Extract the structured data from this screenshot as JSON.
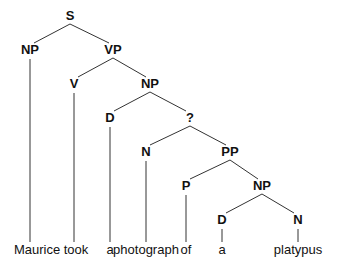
{
  "tree": {
    "nodes": [
      {
        "id": "S",
        "label": "S",
        "x": 70,
        "y": 20
      },
      {
        "id": "NP1",
        "label": "NP",
        "x": 30,
        "y": 54
      },
      {
        "id": "VP",
        "label": "VP",
        "x": 113,
        "y": 54
      },
      {
        "id": "V",
        "label": "V",
        "x": 74,
        "y": 88
      },
      {
        "id": "NP2",
        "label": "NP",
        "x": 150,
        "y": 88
      },
      {
        "id": "D1",
        "label": "D",
        "x": 110,
        "y": 122
      },
      {
        "id": "Q",
        "label": "?",
        "x": 190,
        "y": 122
      },
      {
        "id": "N1",
        "label": "N",
        "x": 146,
        "y": 156
      },
      {
        "id": "PP",
        "label": "PP",
        "x": 230,
        "y": 156
      },
      {
        "id": "P",
        "label": "P",
        "x": 186,
        "y": 190
      },
      {
        "id": "NP3",
        "label": "NP",
        "x": 262,
        "y": 190
      },
      {
        "id": "D2",
        "label": "D",
        "x": 222,
        "y": 224
      },
      {
        "id": "N2",
        "label": "N",
        "x": 298,
        "y": 224
      }
    ],
    "words": [
      {
        "text": "Maurice",
        "x": 37,
        "y": 254,
        "anchor": "middle"
      },
      {
        "text": "took",
        "x": 76,
        "y": 254,
        "anchor": "middle"
      },
      {
        "text": "a",
        "x": 110,
        "y": 254,
        "anchor": "middle"
      },
      {
        "text": "photograph",
        "x": 146,
        "y": 254,
        "anchor": "middle"
      },
      {
        "text": "of",
        "x": 186,
        "y": 254,
        "anchor": "middle"
      },
      {
        "text": "a",
        "x": 222,
        "y": 254,
        "anchor": "middle"
      },
      {
        "text": "platypus",
        "x": 298,
        "y": 254,
        "anchor": "middle"
      }
    ]
  }
}
